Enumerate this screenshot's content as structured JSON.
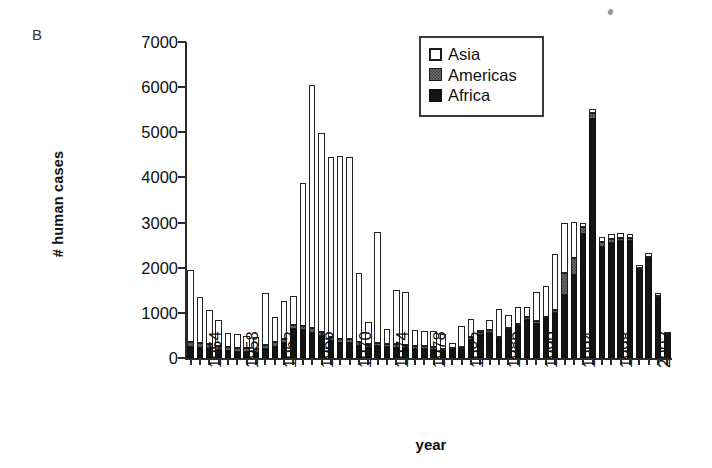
{
  "panel": {
    "label": "B"
  },
  "axes": {
    "ylabel": "# human cases",
    "xlabel": "year",
    "yticks": [
      0,
      1000,
      2000,
      3000,
      4000,
      5000,
      6000,
      7000
    ],
    "ytick_labels": [
      "0",
      "1000",
      "2000",
      "3000",
      "4000",
      "5000",
      "6000",
      "7000"
    ],
    "ylim": [
      0,
      7000
    ],
    "xtick_labels": [
      "1954",
      "1958",
      "1962",
      "1966",
      "1970",
      "1974",
      "1978",
      "1982",
      "1986",
      "1990",
      "1994",
      "1998",
      "2002"
    ],
    "xlim": [
      1953,
      2004
    ]
  },
  "legend": {
    "position": "top-right-inside",
    "entries": [
      {
        "name": "Asia",
        "color": "#ffffff",
        "swatch": "open-square-swatch"
      },
      {
        "name": "Americas",
        "color": "#6e6e6e",
        "swatch": "gray-square-swatch"
      },
      {
        "name": "Africa",
        "color": "#141414",
        "swatch": "black-square-swatch"
      }
    ]
  },
  "chart_data": {
    "type": "bar",
    "subtype": "stacked",
    "title": "",
    "xlabel": "year",
    "ylabel": "# human cases",
    "ylim": [
      0,
      7000
    ],
    "grid": false,
    "legend_position": "upper right",
    "categories": [
      1953,
      1954,
      1955,
      1956,
      1957,
      1958,
      1959,
      1960,
      1961,
      1962,
      1963,
      1964,
      1965,
      1966,
      1967,
      1968,
      1969,
      1970,
      1971,
      1972,
      1973,
      1974,
      1975,
      1976,
      1977,
      1978,
      1979,
      1980,
      1981,
      1982,
      1983,
      1984,
      1985,
      1986,
      1987,
      1988,
      1989,
      1990,
      1991,
      1992,
      1993,
      1994,
      1995,
      1996,
      1997,
      1998,
      1999,
      2000,
      2001,
      2002,
      2003,
      2004
    ],
    "series": [
      {
        "name": "Africa",
        "color": "#141414",
        "values": [
          240,
          230,
          200,
          170,
          150,
          130,
          140,
          120,
          190,
          250,
          330,
          640,
          620,
          560,
          480,
          370,
          330,
          330,
          270,
          230,
          260,
          250,
          230,
          220,
          210,
          200,
          180,
          150,
          170,
          200,
          400,
          520,
          560,
          420,
          610,
          700,
          850,
          760,
          860,
          1000,
          1400,
          1850,
          2750,
          5300,
          2450,
          2550,
          2600,
          2600,
          1950,
          2200,
          1350,
          530
        ]
      },
      {
        "name": "Americas",
        "color": "#6e6e6e",
        "values": [
          120,
          110,
          105,
          100,
          95,
          90,
          90,
          85,
          90,
          95,
          100,
          95,
          90,
          95,
          90,
          90,
          85,
          85,
          80,
          75,
          75,
          70,
          70,
          70,
          65,
          65,
          60,
          55,
          55,
          55,
          60,
          60,
          60,
          55,
          55,
          55,
          50,
          50,
          50,
          55,
          480,
          360,
          150,
          120,
          110,
          90,
          60,
          50,
          40,
          35,
          30,
          20
        ]
      },
      {
        "name": "Asia",
        "color": "#ffffff",
        "values": [
          1590,
          1010,
          770,
          580,
          300,
          310,
          250,
          250,
          1160,
          560,
          830,
          630,
          3160,
          5390,
          4420,
          3990,
          4060,
          4030,
          1540,
          500,
          2450,
          320,
          1200,
          1180,
          350,
          330,
          360,
          330,
          100,
          450,
          400,
          50,
          220,
          610,
          290,
          380,
          230,
          650,
          690,
          1250,
          1120,
          800,
          100,
          100,
          120,
          100,
          100,
          100,
          60,
          90,
          60,
          30
        ]
      }
    ]
  }
}
